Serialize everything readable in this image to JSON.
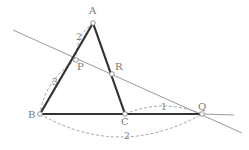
{
  "diagram": {
    "type": "geometry-triangle-with-transversal",
    "colors": {
      "triangle": "#333333",
      "transversal": "#9a9a9a",
      "dashed": "#9a9a9a",
      "point_fill": "#ffffff",
      "point_stroke": "#888888",
      "text": "#777777"
    },
    "points": {
      "A": {
        "label": "A",
        "x": 93,
        "y": 23,
        "lx": 89,
        "ly": 14
      },
      "P": {
        "label": "P",
        "x": 76,
        "y": 60,
        "lx": 77,
        "ly": 70
      },
      "R": {
        "label": "R",
        "x": 112,
        "y": 74,
        "lx": 115,
        "ly": 70
      },
      "B": {
        "label": "B",
        "x": 40,
        "y": 114,
        "lx": 28,
        "ly": 118
      },
      "C": {
        "label": "C",
        "x": 125,
        "y": 114,
        "lx": 121,
        "ly": 125
      },
      "Q": {
        "label": "Q",
        "x": 202,
        "y": 114,
        "lx": 198,
        "ly": 110
      }
    },
    "segments": [
      {
        "name": "AB",
        "from": "A",
        "to": "B"
      },
      {
        "name": "AC",
        "from": "A",
        "to": "C"
      },
      {
        "name": "BC",
        "from": "B",
        "to": "C"
      },
      {
        "name": "CQ",
        "from": "C",
        "to": "Q"
      }
    ],
    "transversal": {
      "x1": 13,
      "y1": 30,
      "x2": 242,
      "y2": 133
    },
    "bc_extension": {
      "x1": 202,
      "y1": 114,
      "x2": 234,
      "y2": 115
    },
    "length_marks": [
      {
        "name": "AP",
        "value": "2",
        "lx": 76,
        "ly": 40
      },
      {
        "name": "PB",
        "value": "3",
        "lx": 52,
        "ly": 85
      },
      {
        "name": "CQ",
        "value": "1",
        "lx": 161,
        "ly": 110
      },
      {
        "name": "BQ",
        "value": "2",
        "lx": 124,
        "ly": 139
      }
    ],
    "arcs": [
      {
        "name": "arc-AP",
        "d": "M93,23 Q76,35 76,60"
      },
      {
        "name": "arc-PB",
        "d": "M76,60 Q45,80 40,114"
      },
      {
        "name": "arc-CQ",
        "d": "M125,114 Q163,98 202,114"
      },
      {
        "name": "arc-BQ",
        "d": "M40,114 Q120,160 202,114"
      }
    ]
  }
}
